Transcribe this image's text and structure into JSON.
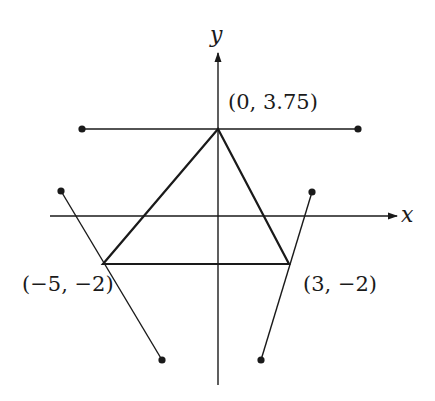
{
  "diagram": {
    "type": "coordinate-plane",
    "colors": {
      "stroke": "#1a1a1a",
      "background": "#ffffff"
    },
    "axes": {
      "x": {
        "label": "x",
        "y_px": 216,
        "from_px": 50,
        "to_px": 397
      },
      "y": {
        "label": "y",
        "x_px": 218,
        "from_px": 385,
        "to_px": 53
      }
    },
    "triangle": {
      "vertices": [
        {
          "label": "(0, 3.75)",
          "x": 0,
          "y": 3.75,
          "px": [
            218,
            129
          ]
        },
        {
          "label": "(-5, -2)",
          "display": "(−5, −2)",
          "x": -5,
          "y": -2,
          "px": [
            103,
            264
          ]
        },
        {
          "label": "(3, -2)",
          "display": "(3, −2)",
          "x": 3,
          "y": -2,
          "px": [
            289,
            264
          ]
        }
      ]
    },
    "segments": [
      {
        "name": "top-horizontal-segment",
        "from": [
          82,
          129
        ],
        "to": [
          358,
          129
        ],
        "endpoints": "dots"
      },
      {
        "name": "left-slanted-segment",
        "from": [
          61,
          191
        ],
        "to": [
          162,
          360
        ],
        "endpoints": "dots"
      },
      {
        "name": "right-slanted-segment",
        "from": [
          312,
          192
        ],
        "to": [
          261,
          360
        ],
        "endpoints": "dots"
      }
    ],
    "labels": {
      "x_axis": "x",
      "y_axis": "y",
      "apex": "(0, 3.75)",
      "left_vertex": "(−5, −2)",
      "right_vertex": "(3, −2)"
    }
  }
}
